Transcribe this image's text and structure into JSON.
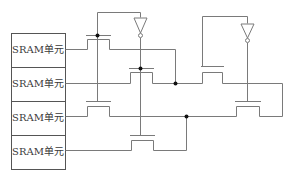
{
  "diagram": {
    "type": "circuit",
    "sram_cells": [
      {
        "label": "SRAM单元"
      },
      {
        "label": "SRAM单元"
      },
      {
        "label": "SRAM单元"
      },
      {
        "label": "SRAM单元"
      }
    ],
    "colors": {
      "wire": "#7a7a7a",
      "box": "#555555",
      "node": "#111111",
      "background": "#ffffff"
    }
  }
}
